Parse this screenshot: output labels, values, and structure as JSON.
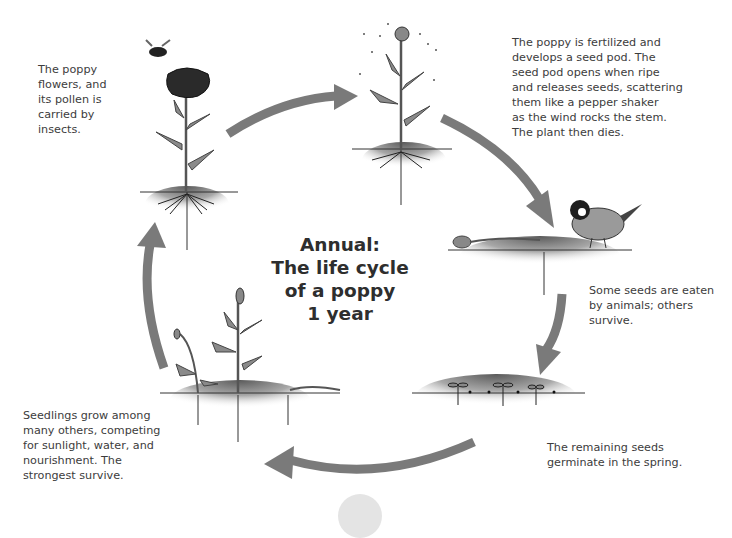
{
  "diagram": {
    "title": "Annual:\nThe life cycle\nof a poppy\n1 year",
    "arrow_color": "#7a7a7a",
    "stages": [
      {
        "id": "flowering",
        "caption": "The poppy\nflowers, and\nits pollen is\ncarried by\ninsects.",
        "illustration": "flowering-poppy-with-bees"
      },
      {
        "id": "seed-pod",
        "caption": "The poppy is fertilized and\ndevelops a seed pod. The\nseed pod opens when ripe\nand releases seeds, scattering\nthem like a pepper shaker\nas the wind rocks the stem.\nThe plant then dies.",
        "illustration": "poppy-seed-pod-scattering-seeds"
      },
      {
        "id": "seeds-eaten",
        "caption": "Some seeds are eaten\nby animals; others\nsurvive.",
        "illustration": "dead-poppy-and-bird"
      },
      {
        "id": "germination",
        "caption": "The remaining seeds\ngerminate in the spring.",
        "illustration": "germinating-seedlings"
      },
      {
        "id": "seedlings",
        "caption": "Seedlings grow among\nmany others, competing\nfor sunlight, water, and\nnourishment. The\nstrongest survive.",
        "illustration": "competing-seedlings"
      }
    ]
  }
}
